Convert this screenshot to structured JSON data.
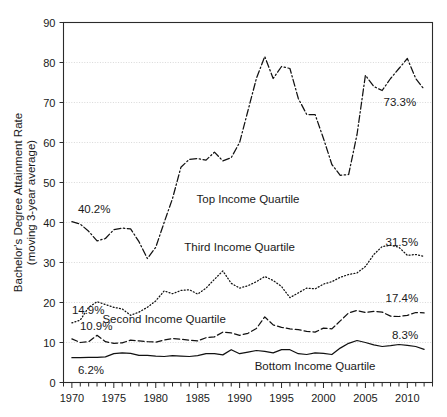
{
  "chart_data": {
    "type": "line",
    "title": "",
    "xlabel": "",
    "ylabel": "Bachelor's Degree Attainment Rate (moving 3-year average)",
    "ylabel_line1": "Bachelor's Degree Attainment Rate",
    "ylabel_line2": "(moving 3-year average)",
    "xlim": [
      1969,
      2013
    ],
    "ylim": [
      0,
      90
    ],
    "yticks": [
      0,
      10,
      20,
      30,
      40,
      50,
      60,
      70,
      80,
      90
    ],
    "ytick_labels": [
      "0",
      "10",
      "20",
      "30",
      "40",
      "50",
      "60",
      "70",
      "80",
      "90"
    ],
    "xticks": [
      1970,
      1975,
      1980,
      1985,
      1990,
      1995,
      2000,
      2005,
      2010
    ],
    "xtick_labels": [
      "1970",
      "1975",
      "1980",
      "1985",
      "1990",
      "1995",
      "2000",
      "2005",
      "2010"
    ],
    "minor_xtick_interval": 1,
    "grid": true,
    "grid_axis": "y",
    "legend": "inline-annotations",
    "x": [
      1970,
      1971,
      1972,
      1973,
      1974,
      1975,
      1976,
      1977,
      1978,
      1979,
      1980,
      1981,
      1982,
      1983,
      1984,
      1985,
      1986,
      1987,
      1988,
      1989,
      1990,
      1991,
      1992,
      1993,
      1994,
      1995,
      1996,
      1997,
      1998,
      1999,
      2000,
      2001,
      2002,
      2003,
      2004,
      2005,
      2006,
      2007,
      2008,
      2009,
      2010,
      2011,
      2012
    ],
    "series": [
      {
        "name": "Top Income Quartile",
        "linestyle": "dash-dot",
        "label_x": 1991,
        "label_y": 45,
        "start_label": "40.2%",
        "end_label": "73.3%",
        "start_value": 40.2,
        "end_value": 73.3,
        "values": [
          40.2,
          39.6,
          37.8,
          35.4,
          36.0,
          38.2,
          38.6,
          38.4,
          35.2,
          31.0,
          33.8,
          40.0,
          46.0,
          53.8,
          55.8,
          56.0,
          55.6,
          57.6,
          55.4,
          56.2,
          60.0,
          68.0,
          76.0,
          81.5,
          76.0,
          79.0,
          78.5,
          71.0,
          67.0,
          67.0,
          61.0,
          54.5,
          51.8,
          52.0,
          62.0,
          76.8,
          74.0,
          73.0,
          76.0,
          78.5,
          81.0,
          76.0,
          73.3
        ]
      },
      {
        "name": "Third Income Quartile",
        "linestyle": "dotted",
        "label_x": 1990,
        "label_y": 33,
        "start_label": "14.9%",
        "end_label": "31.5%",
        "start_value": 14.9,
        "end_value": 31.5,
        "values": [
          14.9,
          15.6,
          18.8,
          20.2,
          19.5,
          18.8,
          18.4,
          16.8,
          17.6,
          18.8,
          20.4,
          22.9,
          22.2,
          23.0,
          23.2,
          22.1,
          23.6,
          25.8,
          27.9,
          24.8,
          23.6,
          24.2,
          25.2,
          26.5,
          25.5,
          24.0,
          21.2,
          22.4,
          23.6,
          23.4,
          24.6,
          25.2,
          26.3,
          27.0,
          27.4,
          29.0,
          32.0,
          34.0,
          34.3,
          33.8,
          31.8,
          32.0,
          31.5
        ]
      },
      {
        "name": "Second Income Quartile",
        "linestyle": "dashed",
        "label_x": 1981,
        "label_y": 14.8,
        "start_label": "10.9%",
        "end_label": "17.4%",
        "start_value": 10.9,
        "end_value": 17.4,
        "values": [
          10.9,
          10.0,
          10.2,
          11.8,
          10.2,
          9.8,
          9.9,
          10.6,
          10.4,
          10.2,
          10.1,
          10.6,
          11.0,
          10.8,
          10.6,
          10.4,
          11.2,
          11.4,
          12.6,
          12.4,
          11.8,
          12.3,
          13.5,
          16.4,
          14.4,
          13.8,
          13.4,
          13.2,
          12.8,
          12.6,
          13.6,
          13.4,
          15.4,
          17.4,
          18.0,
          17.5,
          17.8,
          17.6,
          16.6,
          16.5,
          16.8,
          17.5,
          17.4
        ]
      },
      {
        "name": "Bottom Income Quartile",
        "linestyle": "solid",
        "label_x": 1999,
        "label_y": 3.2,
        "start_label": "6.2%",
        "end_label": "8.3%",
        "start_value": 6.2,
        "end_value": 8.3,
        "values": [
          6.2,
          6.2,
          6.3,
          6.3,
          6.4,
          7.2,
          7.4,
          7.3,
          6.8,
          6.8,
          6.6,
          6.5,
          6.7,
          6.6,
          6.5,
          6.7,
          7.2,
          7.2,
          6.9,
          8.2,
          7.2,
          7.6,
          8.0,
          7.8,
          7.4,
          8.2,
          8.2,
          7.2,
          7.0,
          7.4,
          7.3,
          7.0,
          8.6,
          9.8,
          10.5,
          10.0,
          9.4,
          9.0,
          9.2,
          9.5,
          9.3,
          9.0,
          8.3
        ]
      }
    ]
  }
}
